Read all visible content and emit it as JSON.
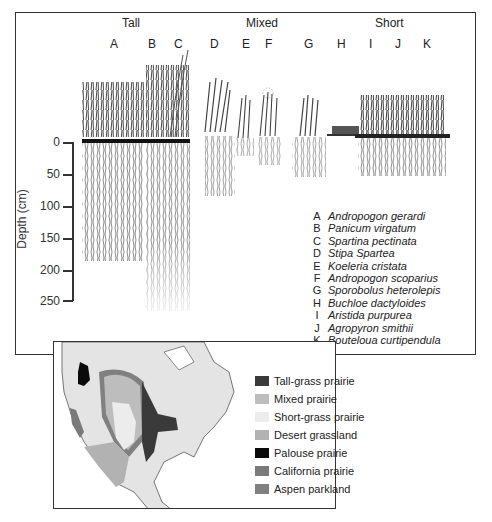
{
  "figure": {
    "groups": [
      {
        "label": "Tall",
        "x": 130
      },
      {
        "label": "Mixed",
        "x": 262
      },
      {
        "label": "Short",
        "x": 390
      }
    ],
    "species_letters": [
      {
        "letter": "A",
        "x": 114
      },
      {
        "letter": "B",
        "x": 152
      },
      {
        "letter": "C",
        "x": 178
      },
      {
        "letter": "D",
        "x": 214
      },
      {
        "letter": "E",
        "x": 245
      },
      {
        "letter": "F",
        "x": 268
      },
      {
        "letter": "G",
        "x": 308
      },
      {
        "letter": "H",
        "x": 341
      },
      {
        "letter": "I",
        "x": 370
      },
      {
        "letter": "J",
        "x": 398
      },
      {
        "letter": "K",
        "x": 427
      }
    ],
    "y_axis": {
      "label": "Depth (cm)",
      "ticks": [
        "0",
        "50",
        "100",
        "150",
        "200",
        "250"
      ]
    },
    "species_legend": [
      {
        "key": "A",
        "name": "Andropogon gerardi"
      },
      {
        "key": "B",
        "name": "Panicum virgatum"
      },
      {
        "key": "C",
        "name": "Spartina pectinata"
      },
      {
        "key": "D",
        "name": "Stipa Spartea"
      },
      {
        "key": "E",
        "name": "Koeleria cristata"
      },
      {
        "key": "F",
        "name": "Andropogon scoparius"
      },
      {
        "key": "G",
        "name": "Sporobolus heterolepis"
      },
      {
        "key": "H",
        "name": "Buchloe dactyloides"
      },
      {
        "key": "I",
        "name": "Aristida purpurea"
      },
      {
        "key": "J",
        "name": "Agropyron smithii"
      },
      {
        "key": "K",
        "name": "Bouteloua curtipendula"
      }
    ]
  },
  "map": {
    "legend": [
      {
        "label": "Tall-grass prairie",
        "color": "#3a3a3a"
      },
      {
        "label": "Mixed prairie",
        "color": "#bdbdbd"
      },
      {
        "label": "Short-grass prairie",
        "color": "#ececec"
      },
      {
        "label": "Desert grassland",
        "color": "#b2b2b2"
      },
      {
        "label": "Palouse prairie",
        "color": "#0a0a0a"
      },
      {
        "label": "California prairie",
        "color": "#7a7a7a"
      },
      {
        "label": "Aspen parkland",
        "color": "#808080"
      }
    ]
  }
}
